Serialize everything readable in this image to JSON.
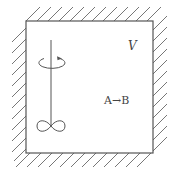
{
  "diagram": {
    "type": "stirred-tank-reactor",
    "volume_label": "V",
    "reaction_label": "A→B",
    "colors": {
      "line": "#555555",
      "hatch": "#777777",
      "background": "#ffffff",
      "text": "#444444"
    },
    "components": {
      "vessel": "rigid-walled box with hatched exterior on all sides",
      "stirrer": "vertical shaft with rotation arrow and two-lobed impeller"
    }
  }
}
